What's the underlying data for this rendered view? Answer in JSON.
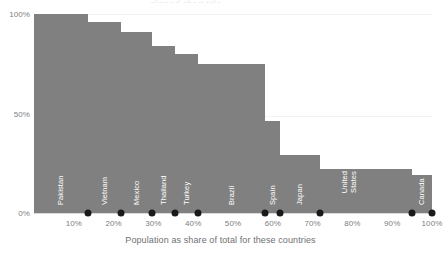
{
  "chart_data": {
    "type": "bar",
    "title": "",
    "xlabel": "Population as share of total for these countries",
    "ylabel": "",
    "categories": [
      "Pakistan",
      "Vietnam",
      "Mexico",
      "Thailand",
      "Turkey",
      "Brazil",
      "Spain",
      "Japan",
      "United States",
      "Canada"
    ],
    "values": [
      100,
      96,
      91,
      84,
      80,
      75,
      46,
      29,
      22,
      19
    ],
    "widths": [
      13.6,
      8.3,
      7.8,
      5.8,
      5.8,
      16.8,
      3.8,
      10.0,
      23.1,
      5.0
    ],
    "cumulative_x": [
      13.6,
      21.9,
      29.7,
      35.5,
      41.3,
      58.1,
      61.9,
      71.9,
      95.0,
      100.0
    ],
    "ylim": [
      0,
      100
    ],
    "xlim": [
      0,
      100
    ],
    "y_ticks": [
      "0%",
      "50%",
      "100%"
    ],
    "y_tick_values": [
      0,
      50,
      100
    ],
    "x_ticks": [
      "10%",
      "20%",
      "30%",
      "40%",
      "50%",
      "60%",
      "70%",
      "80%",
      "90%",
      "100%"
    ],
    "x_tick_values": [
      10,
      20,
      30,
      40,
      50,
      60,
      70,
      80,
      90,
      100
    ],
    "grid": "horizontal-faint",
    "legend": "none",
    "bar_color": "#808080",
    "marker_color": "#1a1a1a",
    "label_color": "#ffffff",
    "axis_text_color": "#7e8082",
    "background_color": "#ffffff",
    "marker_note": "black dot at the foot of each bar's right edge on the baseline"
  },
  "bars": [
    {
      "label": "Pakistan",
      "value": 100,
      "width": 13.6,
      "x_start": 0.0,
      "x_end": 13.6,
      "label_lines": "Pakistan"
    },
    {
      "label": "Vietnam",
      "value": 96,
      "width": 8.3,
      "x_start": 13.6,
      "x_end": 21.9,
      "label_lines": "Vietnam"
    },
    {
      "label": "Mexico",
      "value": 91,
      "width": 7.8,
      "x_start": 21.9,
      "x_end": 29.7,
      "label_lines": "Mexico"
    },
    {
      "label": "Thailand",
      "value": 84,
      "width": 5.8,
      "x_start": 29.7,
      "x_end": 35.5,
      "label_lines": "Thailand"
    },
    {
      "label": "Turkey",
      "value": 80,
      "width": 5.8,
      "x_start": 35.5,
      "x_end": 41.3,
      "label_lines": "Turkey"
    },
    {
      "label": "Brazil",
      "value": 75,
      "width": 16.8,
      "x_start": 41.3,
      "x_end": 58.1,
      "label_lines": "Brazil"
    },
    {
      "label": "Spain",
      "value": 46,
      "width": 3.8,
      "x_start": 58.1,
      "x_end": 61.9,
      "label_lines": "Spain"
    },
    {
      "label": "Japan",
      "value": 29,
      "width": 10.0,
      "x_start": 61.9,
      "x_end": 71.9,
      "label_lines": "Japan"
    },
    {
      "label": "United States",
      "value": 22,
      "width": 23.1,
      "x_start": 71.9,
      "x_end": 95.0,
      "label_lines": "United States"
    },
    {
      "label": "Canada",
      "value": 19,
      "width": 5.0,
      "x_start": 95.0,
      "x_end": 100.0,
      "label_lines": "Canada"
    }
  ],
  "axes": {
    "y_ticks": [
      {
        "label": "100%",
        "value": 100
      },
      {
        "label": "50%",
        "value": 50
      },
      {
        "label": "0%",
        "value": 0
      }
    ],
    "x_ticks": [
      {
        "label": "10%",
        "value": 10
      },
      {
        "label": "20%",
        "value": 20
      },
      {
        "label": "30%",
        "value": 30
      },
      {
        "label": "40%",
        "value": 40
      },
      {
        "label": "50%",
        "value": 50
      },
      {
        "label": "60%",
        "value": 60
      },
      {
        "label": "70%",
        "value": 70
      },
      {
        "label": "80%",
        "value": 80
      },
      {
        "label": "90%",
        "value": 90
      },
      {
        "label": "100%",
        "value": 100
      }
    ],
    "x_title": "Population as share of total for these countries"
  },
  "title_sliver": "clipped chart title"
}
